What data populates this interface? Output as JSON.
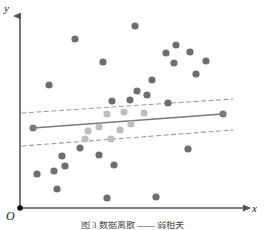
{
  "figure": {
    "caption": "图 3   数据离散 —— 弱相关",
    "axes": {
      "y_label": "y",
      "x_label": "x",
      "origin_label": "O"
    }
  },
  "colors": {
    "axis": "#555555",
    "point_outside": "#6e6e6e",
    "point_inside": "#bdbdbd",
    "regression_line": "#7a7a7a",
    "band_line": "#9a9a9a",
    "origin_dot": "#111111",
    "background": "#ffffff"
  },
  "chart_data": {
    "type": "scatter",
    "title": "",
    "xlabel": "x",
    "ylabel": "y",
    "grid": false,
    "legend": "none",
    "xlim": [
      0,
      265
    ],
    "ylim": [
      0,
      230
    ],
    "axis_origin_px": [
      20,
      208
    ],
    "note": "Pixel-space coordinates of a hand-drawn textbook scatter diagram. Points lying between the two dashed boundary lines are rendered light gray; points outside are dark gray.",
    "point_radius_px": 3.6,
    "series": [
      {
        "name": "points-outside-band",
        "color": "#6e6e6e",
        "points": [
          [
            135,
            26
          ],
          [
            75,
            39
          ],
          [
            103,
            62
          ],
          [
            49,
            85
          ],
          [
            190,
            52
          ],
          [
            176,
            45
          ],
          [
            206,
            61
          ],
          [
            166,
            53
          ],
          [
            174,
            63
          ],
          [
            196,
            74
          ],
          [
            152,
            80
          ],
          [
            137,
            91
          ],
          [
            147,
            95
          ],
          [
            112,
            101
          ],
          [
            130,
            100
          ],
          [
            168,
            103
          ],
          [
            62,
            156
          ],
          [
            80,
            148
          ],
          [
            65,
            166
          ],
          [
            54,
            171
          ],
          [
            99,
            155
          ],
          [
            114,
            165
          ],
          [
            37,
            174
          ],
          [
            57,
            189
          ],
          [
            107,
            198
          ],
          [
            156,
            197
          ],
          [
            188,
            149
          ]
        ]
      },
      {
        "name": "points-inside-band",
        "color": "#bdbdbd",
        "points": [
          [
            107,
            114
          ],
          [
            124,
            112
          ],
          [
            144,
            113
          ],
          [
            131,
            124
          ],
          [
            88,
            131
          ],
          [
            99,
            127
          ],
          [
            120,
            130
          ],
          [
            85,
            139
          ],
          [
            111,
            139
          ]
        ]
      }
    ],
    "lines": [
      {
        "name": "regression-line",
        "style": "solid",
        "color": "#7a7a7a",
        "x1": 33,
        "y1": 128,
        "x2": 223,
        "y2": 114,
        "endpoint_markers": true
      },
      {
        "name": "upper-band-line",
        "style": "dashed",
        "color": "#9a9a9a",
        "x1": 22,
        "y1": 113,
        "x2": 233,
        "y2": 99
      },
      {
        "name": "lower-band-line",
        "style": "dashed",
        "color": "#9a9a9a",
        "x1": 22,
        "y1": 146,
        "x2": 233,
        "y2": 130
      }
    ]
  }
}
